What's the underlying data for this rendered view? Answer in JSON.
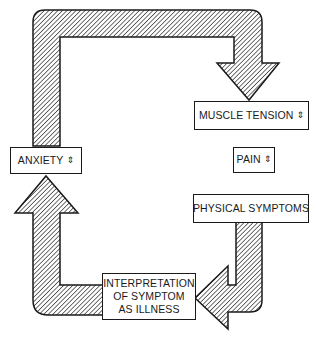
{
  "diagram": {
    "type": "cycle",
    "nodes": [
      {
        "id": "muscle_tension",
        "label": "MUSCLE TENSION",
        "indicator": "⇕"
      },
      {
        "id": "pain",
        "label": "PAIN",
        "indicator": "⇕"
      },
      {
        "id": "physical_symptoms",
        "label": "PHYSICAL SYMPTOMS",
        "indicator": ""
      },
      {
        "id": "interpretation",
        "label_lines": [
          "INTERPRETATION",
          "OF SYMPTOM",
          "AS ILLNESS"
        ]
      },
      {
        "id": "anxiety",
        "label": "ANXIETY",
        "indicator": "⇕"
      }
    ],
    "edges": [
      [
        "anxiety",
        "muscle_tension"
      ],
      [
        "physical_symptoms",
        "interpretation"
      ],
      [
        "interpretation",
        "anxiety"
      ]
    ],
    "colors": {
      "stroke": "#1a1a1a",
      "hatch": "#1a1a1a",
      "background": "#ffffff"
    }
  }
}
